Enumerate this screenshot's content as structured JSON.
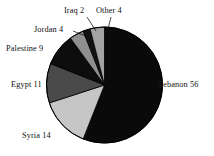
{
  "chart_data": {
    "type": "pie",
    "title": "",
    "categories": [
      "Lebanon",
      "Syria",
      "Egypt",
      "Palestine",
      "Jordan",
      "Iraq",
      "Other"
    ],
    "values": [
      56,
      14,
      11,
      9,
      4,
      2,
      4
    ],
    "labels": [
      "Lebanon 56",
      "Syria 14",
      "Egypt 11",
      "Palestine 9",
      "Jordan 4",
      "Iraq 2",
      "Other 4"
    ],
    "slice_colors": [
      "#0a0a0a",
      "#c6c6c6",
      "#4a4a4a",
      "#0d0d0d",
      "#8f8f8f",
      "#111111",
      "#a3a3a3"
    ],
    "total": 100,
    "start_angle_deg": 0,
    "direction": "clockwise",
    "legend": "none",
    "grid": false,
    "outline_color": "#000000"
  },
  "labels": {
    "lebanon": "Lebanon 56",
    "syria": "Syria 14",
    "egypt": "Egypt 11",
    "palestine": "Palestine 9",
    "jordan": "Jordan 4",
    "iraq": "Iraq 2",
    "other": "Other 4"
  }
}
